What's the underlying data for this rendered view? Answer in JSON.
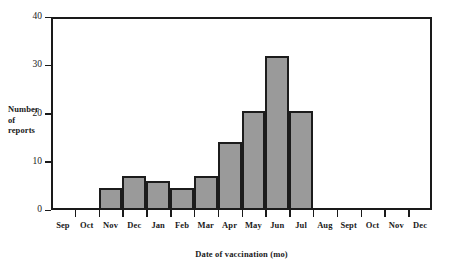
{
  "chart_data": {
    "type": "bar",
    "title": "",
    "xlabel": "Date of vaccination (mo)",
    "ylabel": "Number of reports",
    "ylabel_lines": [
      "Number",
      "of",
      "reports"
    ],
    "categories": [
      "Sep",
      "Oct",
      "Nov",
      "Dec",
      "Jan",
      "Feb",
      "Mar",
      "Apr",
      "May",
      "Jun",
      "Jul",
      "Aug",
      "Sept",
      "Oct",
      "Nov",
      "Dec"
    ],
    "values": [
      0,
      0,
      4.5,
      7,
      6,
      4.5,
      7,
      14,
      20.5,
      32,
      20.5,
      0,
      0,
      0,
      0,
      0
    ],
    "ylim": [
      0,
      40
    ],
    "xlim_categories": 16,
    "yticks": [
      0,
      10,
      20,
      30,
      40
    ],
    "ytick_labels": [
      "0",
      "10",
      "20",
      "30",
      "40"
    ],
    "grid": false,
    "legend": "none",
    "bar_fill_color": "#9a9a9a",
    "bar_edge_color": "#1c1c1c",
    "axis_color": "#1a1a1a",
    "background_color": "#ffffff"
  }
}
